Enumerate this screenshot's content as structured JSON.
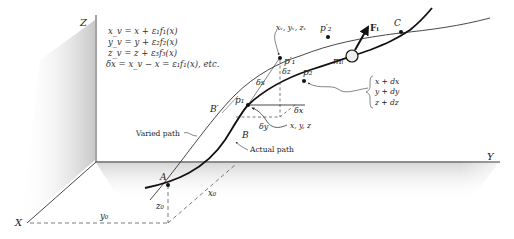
{
  "axes": {
    "z_label": "Z",
    "y_label": "Y",
    "x_label": "X"
  },
  "equations": [
    "x_v  =  x + ε₁f₁(x)",
    "y_v  =  y + ε₂f₂(x)",
    "z_v  =  z + ε₃f₃(x)",
    "δx  =  x_v − x  =  ε₁f₁(x), etc."
  ],
  "paths": {
    "varied_label": "Varied path",
    "actual_label": "Actual path"
  },
  "points": {
    "A": "A",
    "B": "B",
    "B_prime": "B′",
    "C": "C",
    "p1": "p₁",
    "p2": "p₂",
    "p1_prime": "p′₁",
    "p2_prime": "p′₂",
    "mass": "mᵢ",
    "force": "Fᵢ"
  },
  "annotations": {
    "varied_coords": "xᵥ, yᵥ, zᵥ",
    "actual_coords": "x, y, z",
    "delta_s": "δs",
    "delta_z": "δz",
    "delta_x": "δx",
    "delta_y": "δy",
    "neighbor_coords": [
      "x + dx",
      "y + dy",
      "z + dz"
    ],
    "x0": "x₀",
    "y0": "y₀",
    "z0": "z₀"
  }
}
